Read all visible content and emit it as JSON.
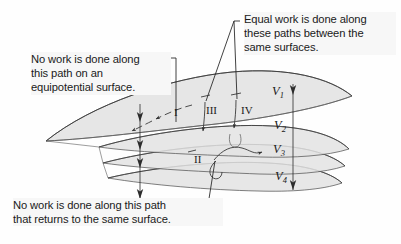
{
  "figure": {
    "background_color": "#fefefe",
    "surface_fill": "#e3e3e3",
    "line_color": "#3a3a3a",
    "text_color": "#1a1a1a",
    "label_background": "#f7f7f7"
  },
  "callouts": [
    {
      "id": "equipotential",
      "text": "No work is done along\nthis path on an\nequipotential surface.",
      "points_to": "path-I"
    },
    {
      "id": "equal-work",
      "text": "Equal work is done along\nthese paths between the\nsame surfaces.",
      "points_to": "path-III and path-IV"
    },
    {
      "id": "returns",
      "text": "No work is done along this path\nthat returns to the same surface.",
      "points_to": "path-II"
    }
  ],
  "surfaces": [
    {
      "label": "V",
      "subscript": "1"
    },
    {
      "label": "V",
      "subscript": "2"
    },
    {
      "label": "V",
      "subscript": "3"
    },
    {
      "label": "V",
      "subscript": "4"
    }
  ],
  "paths": [
    {
      "label": "I",
      "description": "horizontal path along the top equipotential surface"
    },
    {
      "label": "II",
      "description": "looping path that returns to the same surface"
    },
    {
      "label": "III",
      "description": "path from surface V1 down to surface V2"
    },
    {
      "label": "IV",
      "description": "path from surface V1 down to surface V2"
    }
  ],
  "field_lines": [
    {
      "id": "left-field-line",
      "direction": "downward"
    },
    {
      "id": "right-field-line",
      "direction": "downward"
    }
  ]
}
